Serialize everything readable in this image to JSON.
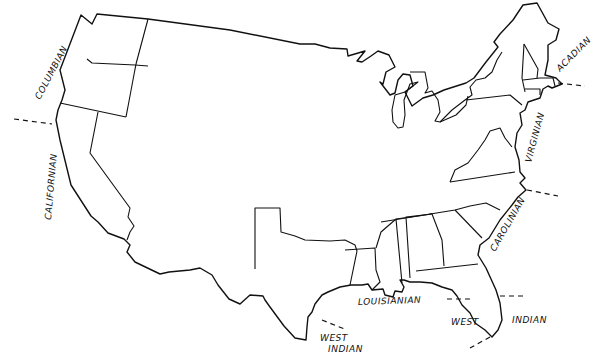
{
  "map": {
    "title": "",
    "subject": "Marine biogeographic provinces of the contiguous United States coastline",
    "line_color": "#111111",
    "background": "#ffffff",
    "provinces": [
      {
        "id": "columbian",
        "label": "COLUMBIAN",
        "coast": "Pacific Northwest"
      },
      {
        "id": "californian",
        "label": "CALIFORNIAN",
        "coast": "Pacific Southwest"
      },
      {
        "id": "acadian",
        "label": "ACADIAN",
        "coast": "North Atlantic"
      },
      {
        "id": "virginian",
        "label": "VIRGINIAN",
        "coast": "Mid Atlantic"
      },
      {
        "id": "carolinian",
        "label": "CAROLINIAN",
        "coast": "South Atlantic"
      },
      {
        "id": "louisianian",
        "label": "LOUISIANIAN",
        "coast": "Northern Gulf of Mexico"
      },
      {
        "id": "west-indian-gulf-line1",
        "label": "WEST",
        "coast": "Western Gulf (Texas)"
      },
      {
        "id": "west-indian-gulf-line2",
        "label": "INDIAN",
        "coast": "Western Gulf (Texas)"
      },
      {
        "id": "west-indian-florida-line1",
        "label": "WEST",
        "coast": "Florida west coast"
      },
      {
        "id": "west-indian-florida-line2",
        "label": "INDIAN",
        "coast": "Florida east coast"
      }
    ],
    "boundary_markers": [
      "columbian-californian",
      "acadian-virginian",
      "virginian-carolinian",
      "louisianian-west-indian-texas",
      "louisianian-west-indian-florida-west",
      "carolinian-west-indian-florida-east",
      "florida-keys-tip"
    ]
  }
}
